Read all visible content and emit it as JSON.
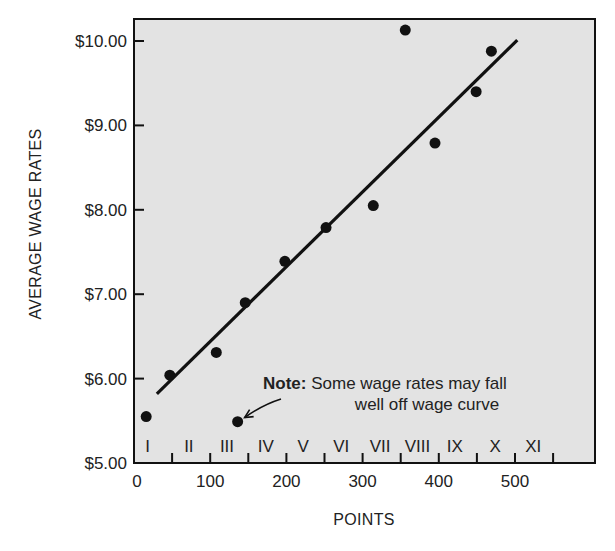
{
  "chart_data": {
    "type": "scatter",
    "title": "",
    "xlabel": "POINTS",
    "ylabel": "AVERAGE WAGE RATES",
    "xlim": [
      0,
      600
    ],
    "ylim": [
      5.0,
      10.25
    ],
    "grid": false,
    "legend": null,
    "x_ticks": [
      0,
      100,
      200,
      300,
      400,
      500
    ],
    "x_minor_ticks": [
      50,
      100,
      150,
      200,
      250,
      300,
      350,
      400,
      450,
      500,
      550
    ],
    "y_ticks": [
      5.0,
      6.0,
      7.0,
      8.0,
      9.0,
      10.0
    ],
    "y_tick_labels": [
      "$5.00",
      "$6.00",
      "$7.00",
      "$8.00",
      "$9.00",
      "$10.00"
    ],
    "x_tick_labels": [
      "0",
      "100",
      "200",
      "300",
      "400",
      "500"
    ],
    "series": [
      {
        "name": "Average wage rate by job",
        "type": "scatter",
        "points": [
          {
            "x": 16,
            "y": 5.55
          },
          {
            "x": 47,
            "y": 6.04
          },
          {
            "x": 108,
            "y": 6.31
          },
          {
            "x": 136,
            "y": 5.49
          },
          {
            "x": 146,
            "y": 6.9
          },
          {
            "x": 198,
            "y": 7.39
          },
          {
            "x": 252,
            "y": 7.79
          },
          {
            "x": 314,
            "y": 8.05
          },
          {
            "x": 356,
            "y": 10.13
          },
          {
            "x": 395,
            "y": 8.79
          },
          {
            "x": 449,
            "y": 9.4
          },
          {
            "x": 469,
            "y": 9.88
          }
        ]
      },
      {
        "name": "Wage curve",
        "type": "line",
        "points": [
          {
            "x": 30,
            "y": 5.82
          },
          {
            "x": 503,
            "y": 10.01
          }
        ]
      }
    ],
    "pay_grades": [
      {
        "label": "I",
        "x_center": 18
      },
      {
        "label": "II",
        "x_center": 72
      },
      {
        "label": "III",
        "x_center": 122
      },
      {
        "label": "IV",
        "x_center": 173
      },
      {
        "label": "V",
        "x_center": 222
      },
      {
        "label": "VI",
        "x_center": 272
      },
      {
        "label": "VII",
        "x_center": 323
      },
      {
        "label": "VIII",
        "x_center": 372
      },
      {
        "label": "IX",
        "x_center": 421
      },
      {
        "label": "X",
        "x_center": 474
      },
      {
        "label": "XI",
        "x_center": 524
      }
    ],
    "annotations": [
      {
        "bold": "Note:",
        "line1": " Some wage rates may fall",
        "line2": "well off wage curve",
        "arrow_to": {
          "x": 136,
          "y": 5.49
        }
      }
    ]
  },
  "labels": {
    "xlabel": "POINTS",
    "ylabel": "AVERAGE WAGE RATES",
    "note_bold": "Note:",
    "note_line1": "Some wage rates may fall",
    "note_line2": "well off wage curve"
  },
  "colors": {
    "plot_background": "#e3e3e3",
    "ink": "#111111",
    "page_background": "#ffffff"
  }
}
